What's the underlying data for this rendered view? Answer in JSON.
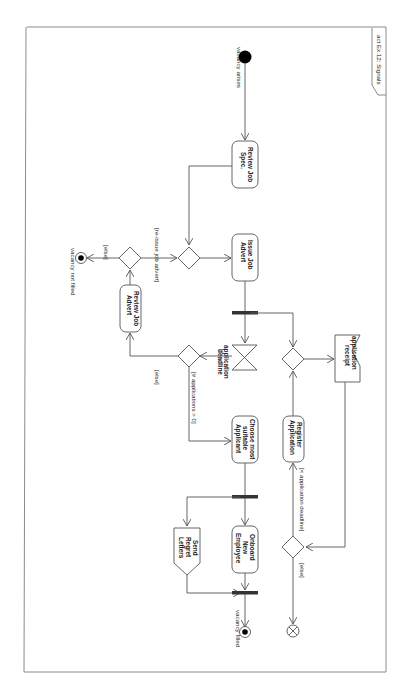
{
  "diagram": {
    "frame_title": "act Ex.12: Signals",
    "orientation": "rotated 90 degrees clockwise",
    "initial_node": {
      "label": "vacancy arises"
    },
    "actions": [
      {
        "id": "review_spec",
        "label_lines": [
          "Review Job",
          "Spec."
        ]
      },
      {
        "id": "issue_advert",
        "label_lines": [
          "Issue Job",
          "Advert"
        ]
      },
      {
        "id": "review_advert",
        "label_lines": [
          "Review Job",
          "Advert"
        ]
      },
      {
        "id": "choose",
        "label_lines": [
          "Choose most",
          "suitable",
          "Applicant"
        ]
      },
      {
        "id": "register",
        "label_lines": [
          "Register",
          "Application"
        ]
      },
      {
        "id": "onboard",
        "label_lines": [
          "Onboard",
          "New",
          "Employee"
        ]
      }
    ],
    "send_signal": {
      "label_lines": [
        "Send",
        "Regret",
        "Letters"
      ]
    },
    "accept_event": {
      "label_lines": [
        "application",
        "receipt"
      ]
    },
    "time_event": {
      "label_lines": [
        "application",
        "deadline"
      ]
    },
    "guards": {
      "reissue": "[re-issue job advert]",
      "else_1": "[else]",
      "apps_gt_0": "[# applications > 0]",
      "else_2": "[else]",
      "before_deadline": "[< application deadline]",
      "else_3": "[else]"
    },
    "final_nodes": {
      "not_filled": "vacancy not filled",
      "filled": "vacancy filled"
    }
  }
}
